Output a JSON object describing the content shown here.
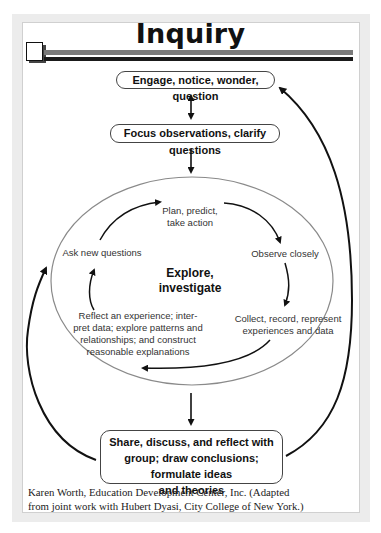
{
  "title": "Inquiry",
  "nodes": {
    "engage": "Engage, notice, wonder, question",
    "focus": "Focus observations, clarify questions",
    "share_lines": [
      "Share, discuss, and reflect with",
      "group; draw conclusions; formulate ideas",
      "and theories"
    ]
  },
  "cycle": {
    "center_lines": [
      "Explore,",
      "investigate"
    ],
    "plan_lines": [
      "Plan, predict,",
      "take action"
    ],
    "observe": "Observe closely",
    "collect_lines": [
      "Collect, record, represent",
      "experiences and data"
    ],
    "reflect_lines": [
      "Reflect an experience; inter-",
      "pret data; explore patterns and",
      "relationships; and construct",
      "reasonable explanations"
    ],
    "ask": "Ask new questions"
  },
  "credit_lines": [
    "Karen Worth, Education Development Center, Inc. (Adapted",
    "from joint work with Hubert Dyasi, City College of New York.)"
  ],
  "colors": {
    "frame": "#ececec",
    "ellipse_stroke": "#8a8a8a",
    "arrow": "#111111"
  }
}
